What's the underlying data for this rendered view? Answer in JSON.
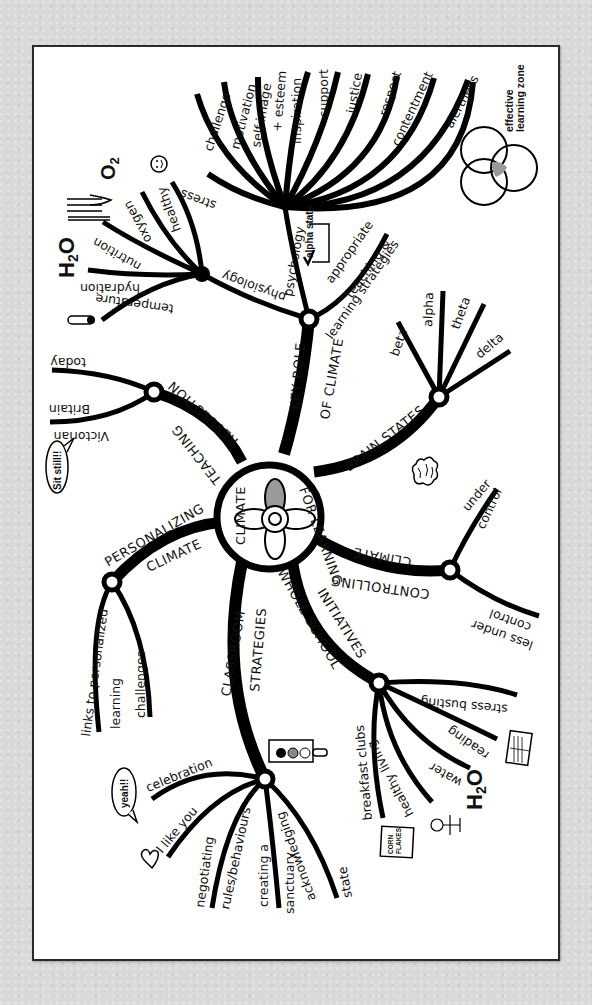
{
  "title": "Climate for Learning",
  "center": {
    "line1": "CLIMATE",
    "line2": "FOR LEARNING"
  },
  "branches": {
    "key_role": {
      "label1": "KEY ROLE",
      "label2": "OF CLIMATE",
      "sub": {
        "psychology": {
          "label": "psychology",
          "badge": "alpha state",
          "items": [
            "stress",
            "challenge",
            "motivation",
            "self image",
            "+ esteem",
            "inspiration",
            "support",
            "justice",
            "respect",
            "contentment",
            "alertness"
          ]
        },
        "physiology": {
          "label": "physiology",
          "items": [
            "temperature",
            "hydration",
            "nutrition",
            "oxygen",
            "healthy"
          ],
          "icons": {
            "h2o": "H2O",
            "o2": "O2"
          }
        },
        "teaching": {
          "label1": "appropriate",
          "label2": "teaching &",
          "label3": "learning strategies"
        }
      },
      "side_note": "effective learning zone"
    },
    "brain_states": {
      "label": "BRAIN STATES",
      "items": [
        "beta",
        "alpha",
        "theta",
        "delta"
      ]
    },
    "controlling": {
      "label1": "CONTROLLING",
      "label2": "CLIMATE",
      "items": [
        {
          "a": "under",
          "b": "control"
        },
        {
          "a": "less under",
          "b": "control"
        }
      ]
    },
    "whole_school": {
      "label1": "WHOLE SCHOOL",
      "label2": "INITIATIVES",
      "items": [
        "breakfast clubs",
        "healthy living",
        "water",
        "reading",
        "stress busting"
      ],
      "icons": {
        "cereal1": "CORN",
        "cereal2": "FLAKES",
        "h2o": "H2O"
      }
    },
    "classroom": {
      "label1": "CLASSROOM",
      "label2": "STRATEGIES",
      "items": [
        "celebration",
        "I like you",
        "negotiating",
        "rules/behaviours",
        "creating a",
        "sanctuary",
        "acknowledging",
        "state"
      ],
      "bubble": "yeah!!"
    },
    "personalizing": {
      "label1": "PERSONALIZING",
      "label2": "CLIMATE",
      "items": [
        "links to personalized",
        "learning",
        "challenges"
      ]
    },
    "teaching_revolution": {
      "label1": "TEACHING",
      "label2": "REVOLUTION",
      "items": [
        "today",
        "Victorian",
        "Britain"
      ],
      "bubble": "Sit still!!"
    }
  },
  "colors": {
    "background": "#d9d9d9",
    "card": "#ffffff",
    "ink": "#000000",
    "accent_grey": "#9a9a9a"
  }
}
